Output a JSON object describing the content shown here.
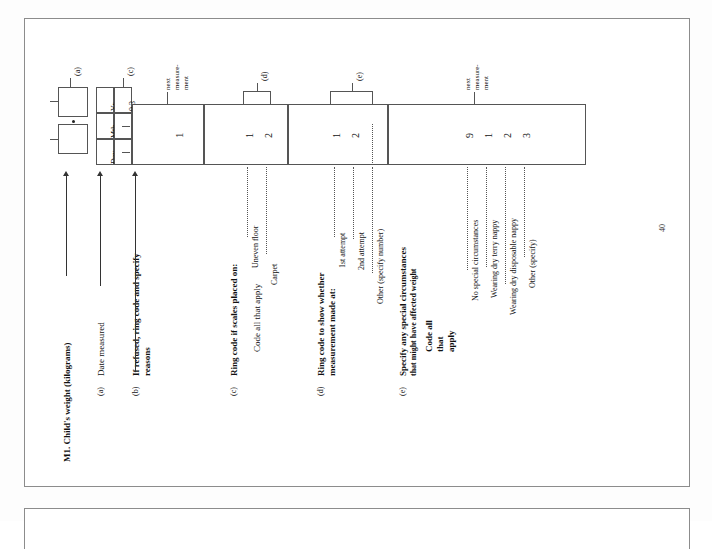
{
  "document": {
    "page_number": "40",
    "title": "M1. Child's weight (kilograms)"
  },
  "questions": [
    {
      "key": "main",
      "letter": "",
      "label": "M1. Child's weight (kilograms)",
      "label2": ""
    },
    {
      "key": "a",
      "letter": "(a)",
      "label": "Date measured",
      "label2": ""
    },
    {
      "key": "b",
      "letter": "(b)",
      "label": "If refused, ring code and specify",
      "label2": "reasons"
    },
    {
      "key": "c",
      "letter": "(c)",
      "label": "Ring code if scales placed on:",
      "label2": "",
      "instruction": "Code all that apply"
    },
    {
      "key": "d",
      "letter": "(d)",
      "label": "Ring code to show whether",
      "label2": "measurement made at:"
    },
    {
      "key": "e",
      "letter": "(e)",
      "label": "Specify any special circumstances",
      "label2": "that might have affected weight",
      "instruction_lines": [
        "Code all",
        "that",
        "apply"
      ]
    }
  ],
  "date_grid": {
    "headers": [
      "Day",
      "Mth",
      "Yr"
    ],
    "values": [
      "",
      "",
      "9 3"
    ]
  },
  "weight_entry": {
    "separator": ".",
    "boxes": [
      "",
      ""
    ]
  },
  "refusal": {
    "code": "1",
    "annotation_lines": [
      "next",
      "measure-",
      "ment"
    ]
  },
  "options_c": {
    "marker": "(d)",
    "items": [
      {
        "label": "Uneven floor",
        "code": "1"
      },
      {
        "label": "Carpet",
        "code": "2"
      }
    ]
  },
  "options_d": {
    "marker": "(e)",
    "items": [
      {
        "label": "1st attempt",
        "code": "1"
      },
      {
        "label": "2nd attempt",
        "code": "2"
      },
      {
        "label": "Other (specify number)",
        "code": ""
      }
    ]
  },
  "options_e": {
    "annotation_lines": [
      "next",
      "measure-",
      "ment"
    ],
    "items": [
      {
        "label": "No special circumstances",
        "code": "9"
      },
      {
        "label": "Wearing dry terry nappy",
        "code": "1"
      },
      {
        "label": "Wearing dry disposable nappy",
        "code": "2"
      },
      {
        "label": "Other (specify)",
        "code": "3"
      }
    ]
  },
  "colors": {
    "paper": "#ffffff",
    "ink": "#111111",
    "rule": "#555555",
    "page_edge": "#8c8c8c"
  }
}
